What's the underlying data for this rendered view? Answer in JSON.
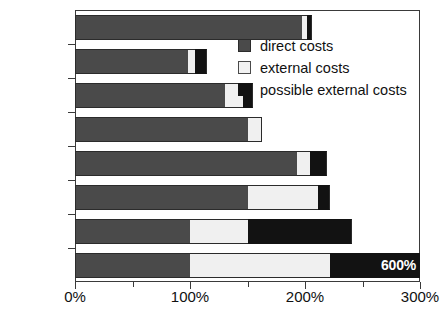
{
  "chart_data": {
    "type": "bar",
    "orientation": "horizontal",
    "stacked": true,
    "title": "",
    "xlabel": "",
    "ylabel": "",
    "xlim": [
      0,
      300
    ],
    "grid": false,
    "legend_position": "upper-right",
    "xticks": [
      0,
      100,
      200,
      300
    ],
    "xticklabels": [
      "0%",
      "100%",
      "200%",
      "300%"
    ],
    "categories": [
      "Fusion",
      "Fission",
      "Wind",
      "Hydro",
      "Solar",
      "Biomass",
      "Gas",
      "Coal"
    ],
    "series": [
      {
        "name": "direct costs",
        "color": "#4a4a4a",
        "values": [
          197,
          98,
          130,
          150,
          193,
          150,
          100,
          100
        ]
      },
      {
        "name": "external costs",
        "color": "#f0f0f0",
        "values": [
          5,
          6,
          16,
          13,
          11,
          61,
          50,
          122
        ]
      },
      {
        "name": "possible external costs",
        "color": "#121212",
        "values": [
          4,
          11,
          9,
          0,
          15,
          11,
          91,
          78
        ]
      }
    ],
    "totals": [
      206,
      115,
      155,
      163,
      219,
      222,
      241,
      300
    ],
    "annotations": [
      {
        "category": "Coal",
        "text": "600%",
        "position": "bar-end-inside",
        "note": "Coal bar is truncated at the 300% axis limit; true total is 600%"
      }
    ]
  },
  "legend": {
    "items": [
      {
        "label": "direct costs",
        "swatch": "direct-costs-swatch"
      },
      {
        "label": "external costs",
        "swatch": "external-costs-swatch"
      },
      {
        "label": "possible external costs",
        "swatch": "possible-external-costs-swatch"
      }
    ]
  }
}
